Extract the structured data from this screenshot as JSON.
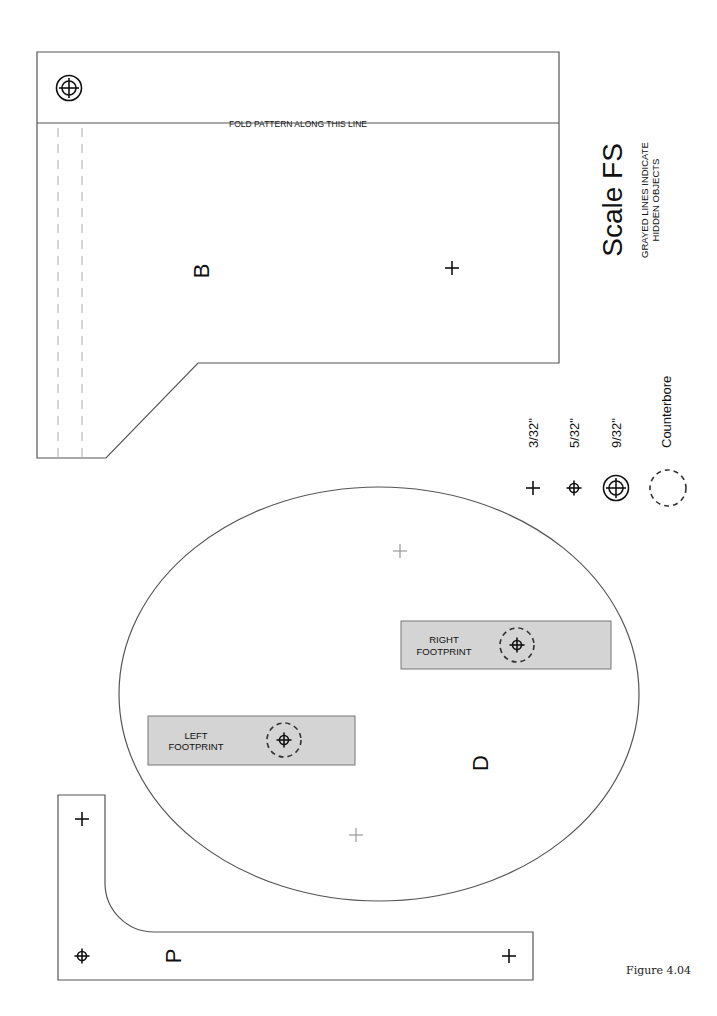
{
  "figure": {
    "caption": "Figure 4.04",
    "scale_title": "Scale FS",
    "note_line1": "GRAYED LINES INDICATE",
    "note_line2": "HIDDEN OBJECTS"
  },
  "pieces": {
    "b": {
      "label": "B",
      "fold_text": "FOLD PATTERN  ALONG THIS LINE"
    },
    "d": {
      "label": "D",
      "left_footprint": {
        "line1": "LEFT",
        "line2": "FOOTPRINT"
      },
      "right_footprint": {
        "line1": "RIGHT",
        "line2": "FOOTPRINT"
      }
    },
    "p": {
      "label": "P"
    }
  },
  "legend": {
    "items": [
      {
        "symbol": "plus-hole-icon",
        "label": "3/32\""
      },
      {
        "symbol": "crosshair-hole-icon",
        "label": "5/32\""
      },
      {
        "symbol": "circled-crosshair-hole-icon",
        "label": "9/32\""
      },
      {
        "symbol": "counterbore-icon",
        "label": "Counterbore"
      }
    ]
  },
  "colors": {
    "footprint_fill": "#d4d4d4",
    "hidden_line": "#aaaaaa",
    "outline": "#555555"
  }
}
